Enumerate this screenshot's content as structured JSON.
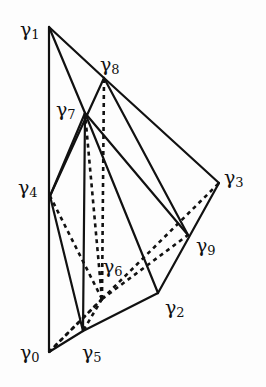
{
  "diagram": {
    "title": "",
    "stroke_color": "#111111",
    "background": "#fdfdfd",
    "vertices": [
      {
        "id": "g0",
        "symbol": "γ",
        "index": "0",
        "x": 49,
        "y": 352,
        "label_x": 20,
        "label_y": 343
      },
      {
        "id": "g1",
        "symbol": "γ",
        "index": "1",
        "x": 49,
        "y": 27,
        "label_x": 20,
        "label_y": 20
      },
      {
        "id": "g2",
        "symbol": "γ",
        "index": "2",
        "x": 158,
        "y": 293,
        "label_x": 165,
        "label_y": 298
      },
      {
        "id": "g3",
        "symbol": "γ",
        "index": "3",
        "x": 219,
        "y": 183,
        "label_x": 224,
        "label_y": 168
      },
      {
        "id": "g4",
        "symbol": "γ",
        "index": "4",
        "x": 50,
        "y": 196,
        "label_x": 18,
        "label_y": 178
      },
      {
        "id": "g5",
        "symbol": "γ",
        "index": "5",
        "x": 83,
        "y": 331,
        "label_x": 82,
        "label_y": 343
      },
      {
        "id": "g6",
        "symbol": "γ",
        "index": "6",
        "x": 102,
        "y": 299,
        "label_x": 103,
        "label_y": 257
      },
      {
        "id": "g7",
        "symbol": "γ",
        "index": "7",
        "x": 85,
        "y": 113,
        "label_x": 56,
        "label_y": 100
      },
      {
        "id": "g8",
        "symbol": "γ",
        "index": "8",
        "x": 104,
        "y": 78,
        "label_x": 100,
        "label_y": 55
      },
      {
        "id": "g9",
        "symbol": "γ",
        "index": "9",
        "x": 188,
        "y": 235,
        "label_x": 196,
        "label_y": 236
      }
    ],
    "solid_edges": [
      [
        "g0",
        "g1"
      ],
      [
        "g1",
        "g8"
      ],
      [
        "g8",
        "g3"
      ],
      [
        "g1",
        "g7"
      ],
      [
        "g7",
        "g9"
      ],
      [
        "g8",
        "g9"
      ],
      [
        "g8",
        "g4"
      ],
      [
        "g7",
        "g4"
      ],
      [
        "g7",
        "g5"
      ],
      [
        "g7",
        "g2"
      ],
      [
        "g4",
        "g5"
      ],
      [
        "g0",
        "g5"
      ],
      [
        "g5",
        "g2"
      ],
      [
        "g2",
        "g3"
      ]
    ],
    "dashed_edges": [
      [
        "g6",
        "g7"
      ],
      [
        "g6",
        "g8"
      ],
      [
        "g6",
        "g4"
      ],
      [
        "g6",
        "g0"
      ],
      [
        "g6",
        "g5"
      ],
      [
        "g6",
        "g3"
      ],
      [
        "g6",
        "g9"
      ],
      [
        "g0",
        "g6"
      ]
    ]
  }
}
